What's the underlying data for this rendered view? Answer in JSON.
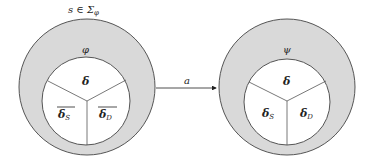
{
  "diagram": {
    "state_label": "s ∈ Σ",
    "state_label_sub": "φ",
    "transition_label": "a",
    "left_node": {
      "outer_label": "φ",
      "segments": {
        "top": "δ",
        "left": "δ",
        "left_sub": "S",
        "right": "δ",
        "right_sub": "D"
      },
      "overlined": [
        "left",
        "right"
      ]
    },
    "right_node": {
      "outer_label": "ψ",
      "segments": {
        "top": "δ",
        "left": "δ",
        "left_sub": "S",
        "right": "δ",
        "right_sub": "D"
      },
      "overlined": []
    },
    "colors": {
      "ring_fill": "#d9d9d9",
      "stroke": "#555555",
      "inner_fill": "#ffffff"
    }
  }
}
